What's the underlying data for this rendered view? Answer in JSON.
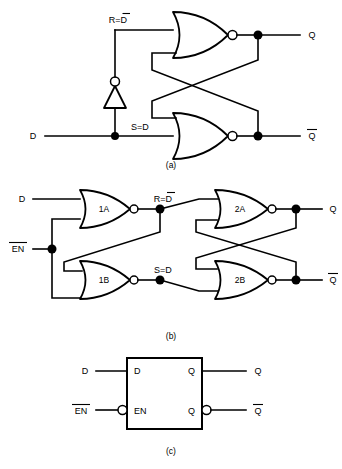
{
  "figure": {
    "background_color": "#ffffff",
    "ink_color": "#000000"
  },
  "parts": [
    {
      "id": "a",
      "caption": "(a)",
      "description": "NOR-based SR latch with inverter generating R from D",
      "inputs": [
        {
          "name": "D",
          "label": "D"
        }
      ],
      "internal_signals": [
        {
          "name": "R",
          "label": "R=D",
          "overbar_on": "D"
        },
        {
          "name": "S",
          "label": "S=D",
          "overbar_on": ""
        }
      ],
      "outputs": [
        {
          "name": "Q",
          "label": "Q",
          "overbar": false
        },
        {
          "name": "Qbar",
          "label": "Q",
          "overbar": true
        }
      ],
      "gates": [
        {
          "id": "nor-top",
          "type": "NOR",
          "label": ""
        },
        {
          "id": "nor-bottom",
          "type": "NOR",
          "label": ""
        },
        {
          "id": "inverter",
          "type": "NOT",
          "label": ""
        }
      ]
    },
    {
      "id": "b",
      "caption": "(b)",
      "description": "Gated D latch built from four NOR gates",
      "inputs": [
        {
          "name": "D",
          "label": "D",
          "overbar": false
        },
        {
          "name": "ENbar",
          "label": "EN",
          "overbar": true
        }
      ],
      "internal_signals": [
        {
          "name": "R",
          "label": "R=D",
          "overbar_on": "D"
        },
        {
          "name": "S",
          "label": "S=D",
          "overbar_on": ""
        }
      ],
      "outputs": [
        {
          "name": "Q",
          "label": "Q",
          "overbar": false
        },
        {
          "name": "Qbar",
          "label": "Q",
          "overbar": true
        }
      ],
      "gates": [
        {
          "id": "gate-1a",
          "type": "NOR",
          "label": "1A"
        },
        {
          "id": "gate-1b",
          "type": "NOR",
          "label": "1B"
        },
        {
          "id": "gate-2a",
          "type": "NOR",
          "label": "2A"
        },
        {
          "id": "gate-2b",
          "type": "NOR",
          "label": "2B"
        }
      ]
    },
    {
      "id": "c",
      "caption": "(c)",
      "description": "Block symbol for the D latch",
      "block": {
        "pins_left": [
          {
            "name": "D",
            "label": "D",
            "inverted": false,
            "external_label": "D",
            "external_overbar": false
          },
          {
            "name": "EN",
            "label": "EN",
            "inverted": true,
            "external_label": "EN",
            "external_overbar": true
          }
        ],
        "pins_right": [
          {
            "name": "Q",
            "label": "Q",
            "inverted": false,
            "external_label": "Q",
            "external_overbar": false
          },
          {
            "name": "Qbar",
            "label": "Q",
            "inverted": true,
            "external_label": "Q",
            "external_overbar": true
          }
        ]
      }
    }
  ]
}
